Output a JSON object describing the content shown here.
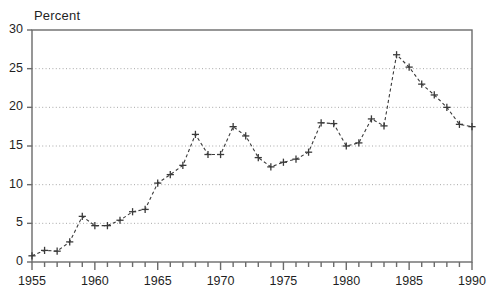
{
  "chart_data": {
    "type": "line",
    "title": "",
    "subtitle": "",
    "xlabel": "",
    "ylabel": "Percent",
    "ylabel_position": "top-left",
    "xlim": [
      1955,
      1990
    ],
    "ylim": [
      0,
      30
    ],
    "ytick_interval": 5,
    "xtick_major_interval": 5,
    "xtick_minor_interval": 1,
    "grid": true,
    "grid_axis": "y",
    "grid_style": "dotted",
    "legend": false,
    "legend_position": "none",
    "marker": "plus",
    "line_style": "dashed",
    "series_color": "#3a3a3a",
    "x": [
      1955,
      1956,
      1957,
      1958,
      1959,
      1960,
      1961,
      1962,
      1963,
      1964,
      1965,
      1966,
      1967,
      1968,
      1969,
      1970,
      1971,
      1972,
      1973,
      1974,
      1975,
      1976,
      1977,
      1978,
      1979,
      1980,
      1981,
      1982,
      1983,
      1984,
      1985,
      1986,
      1987,
      1988,
      1989,
      1990
    ],
    "values": [
      0.8,
      1.5,
      1.4,
      2.6,
      5.9,
      4.7,
      4.7,
      5.4,
      6.5,
      6.8,
      10.2,
      11.3,
      12.5,
      16.5,
      13.9,
      13.9,
      17.5,
      16.3,
      13.5,
      12.3,
      12.9,
      13.3,
      14.2,
      18.0,
      17.9,
      15.0,
      15.4,
      18.5,
      17.6,
      26.8,
      25.2,
      23.0,
      21.6,
      20.0,
      17.8,
      17.5
    ],
    "ytick_labels": [
      "0",
      "5",
      "10",
      "15",
      "20",
      "25",
      "30"
    ],
    "ytick_values": [
      0,
      5,
      10,
      15,
      20,
      25,
      30
    ],
    "xtick_labels": [
      "1955",
      "1960",
      "1965",
      "1970",
      "1975",
      "1980",
      "1985",
      "1990"
    ],
    "xtick_values": [
      1955,
      1960,
      1965,
      1970,
      1975,
      1980,
      1985,
      1990
    ]
  },
  "geometry": {
    "plot_left": 32,
    "plot_right": 472,
    "plot_top": 30,
    "plot_bottom": 262
  },
  "colors": {
    "frame": "#6b6b6b",
    "grid": "#a8a8a8",
    "series": "#3a3a3a",
    "text": "#1f1f1f",
    "background": "#ffffff"
  }
}
